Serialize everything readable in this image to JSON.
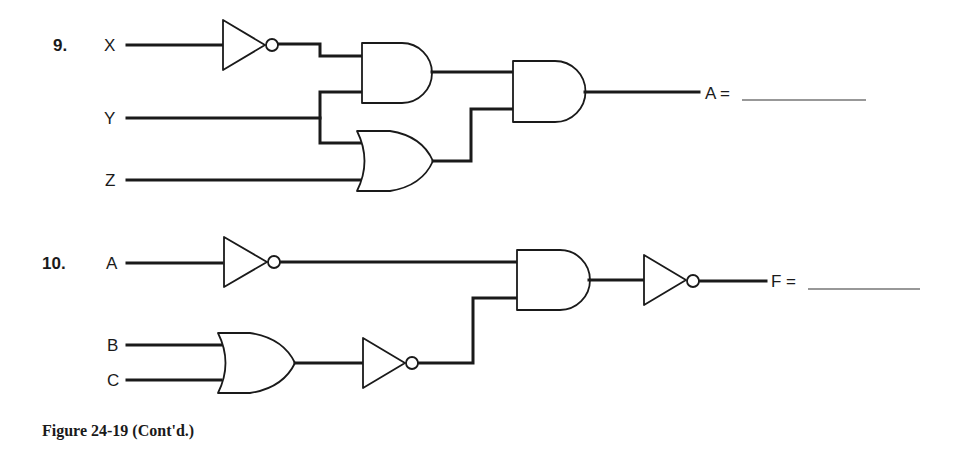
{
  "problems": [
    {
      "number": "9.",
      "inputs": [
        "X",
        "Y",
        "Z"
      ],
      "output_label": "A =",
      "gates": [
        "NOT(X)",
        "AND(NOT X, Y)",
        "OR(Y, Z)",
        "AND(AND1, OR1)"
      ]
    },
    {
      "number": "10.",
      "inputs": [
        "A",
        "B",
        "C"
      ],
      "output_label": "F =",
      "gates": [
        "NOT(A)",
        "OR(B, C)",
        "NOT(OR1)",
        "AND(NOT A, NOT OR1)",
        "NOT(AND1)"
      ]
    }
  ],
  "caption": "Figure 24-19 (Cont'd.)",
  "colors": {
    "ink": "#1a1a1a",
    "background": "#ffffff"
  }
}
